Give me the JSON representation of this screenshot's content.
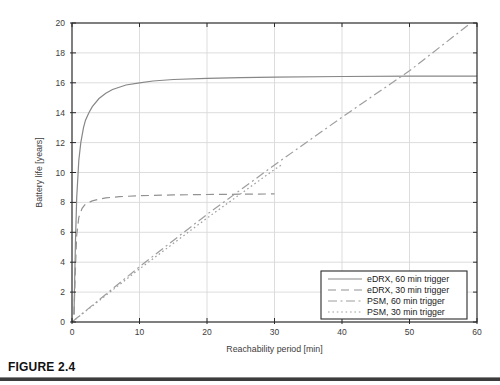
{
  "figure": {
    "caption": "FIGURE 2.4"
  },
  "colors": {
    "axis": "#2b2b2b",
    "grid": "#d9d9d9",
    "tick_label": "#3d3d3d",
    "legend_border": "#2b2b2b",
    "legend_text": "#1a1a1a",
    "caption_rule": "#3c3c3c"
  },
  "chart_data": {
    "type": "line",
    "title": "",
    "xlabel": "Reachability period [min]",
    "ylabel": "Battery life [years]",
    "xlim": [
      0,
      60
    ],
    "ylim": [
      0,
      20
    ],
    "xticks": [
      0,
      10,
      20,
      30,
      40,
      50,
      60
    ],
    "yticks": [
      0,
      2,
      4,
      6,
      8,
      10,
      12,
      14,
      16,
      18,
      20
    ],
    "grid": true,
    "legend_position": "lower right",
    "series": [
      {
        "name": "eDRX, 60 min trigger",
        "style": "solid",
        "color": "#878787",
        "points": [
          [
            0.3,
            0.5
          ],
          [
            0.5,
            5.2
          ],
          [
            0.7,
            8.3
          ],
          [
            1,
            10.8
          ],
          [
            1.3,
            12.0
          ],
          [
            1.7,
            13.0
          ],
          [
            2,
            13.5
          ],
          [
            2.5,
            14.0
          ],
          [
            3,
            14.4
          ],
          [
            4,
            14.95
          ],
          [
            5,
            15.3
          ],
          [
            6,
            15.55
          ],
          [
            8,
            15.85
          ],
          [
            10,
            16.0
          ],
          [
            12,
            16.12
          ],
          [
            15,
            16.22
          ],
          [
            20,
            16.3
          ],
          [
            25,
            16.35
          ],
          [
            30,
            16.38
          ],
          [
            40,
            16.42
          ],
          [
            50,
            16.44
          ],
          [
            60,
            16.45
          ]
        ]
      },
      {
        "name": "eDRX, 30 min trigger",
        "style": "dashed",
        "color": "#929292",
        "points": [
          [
            0.3,
            0.5
          ],
          [
            0.5,
            3.5
          ],
          [
            0.7,
            5.8
          ],
          [
            1,
            7.0
          ],
          [
            1.5,
            7.6
          ],
          [
            2,
            7.9
          ],
          [
            2.5,
            8.0
          ],
          [
            3,
            8.1
          ],
          [
            4,
            8.22
          ],
          [
            5,
            8.3
          ],
          [
            7,
            8.38
          ],
          [
            10,
            8.45
          ],
          [
            15,
            8.5
          ],
          [
            20,
            8.53
          ],
          [
            25,
            8.55
          ],
          [
            30,
            8.57
          ]
        ]
      },
      {
        "name": "PSM, 60 min trigger",
        "style": "dashdot",
        "color": "#9e9e9e",
        "points": [
          [
            0,
            0
          ],
          [
            10,
            3.7
          ],
          [
            20,
            7.2
          ],
          [
            30,
            10.5
          ],
          [
            40,
            13.7
          ],
          [
            50,
            16.8
          ],
          [
            58.8,
            19.9
          ]
        ]
      },
      {
        "name": "PSM, 30 min trigger",
        "style": "dotted",
        "color": "#9e9e9e",
        "points": [
          [
            0,
            0
          ],
          [
            10,
            3.55
          ],
          [
            20,
            6.95
          ],
          [
            30,
            10.2
          ],
          [
            31,
            10.5
          ]
        ]
      }
    ]
  }
}
